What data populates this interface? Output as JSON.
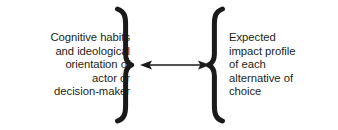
{
  "diagram": {
    "type": "bidirectional-relationship",
    "background_color": "#ffffff",
    "text_color": "#241f20",
    "stroke_color": "#1a1a1a",
    "left": {
      "label": "Cognitive habits\nand ideological\norientation of\nactor or\ndecision-maker",
      "lines": [
        "Cognitive habits",
        "and ideological",
        "orientation of",
        "actor or",
        "decision-maker"
      ],
      "align": "right",
      "brace": "right-curly-brace"
    },
    "right": {
      "label": "Expected\nimpact profile\nof each\nalternative of\nchoice",
      "lines": [
        "Expected",
        "impact profile",
        "of each",
        "alternative of",
        "choice"
      ],
      "align": "left",
      "brace": "left-curly-brace"
    },
    "connector": {
      "name": "double-headed-arrow",
      "direction": "bidirectional"
    }
  }
}
